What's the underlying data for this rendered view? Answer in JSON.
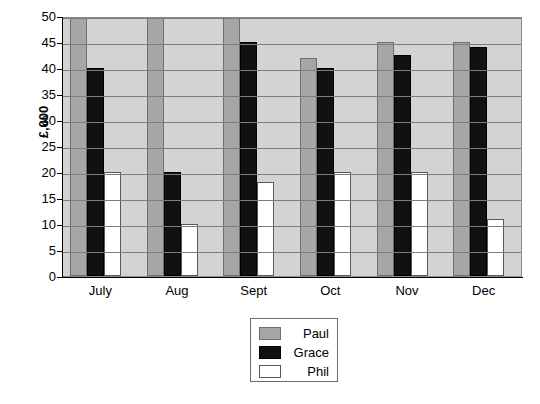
{
  "chart_data": {
    "type": "bar",
    "title": "",
    "xlabel": "",
    "ylabel": "£,000",
    "categories": [
      "July",
      "Aug",
      "Sept",
      "Oct",
      "Nov",
      "Dec"
    ],
    "ylim": [
      0,
      50
    ],
    "ytick_step": 5,
    "yticks": [
      50,
      45,
      40,
      35,
      30,
      25,
      20,
      15,
      10,
      5,
      0
    ],
    "grid": true,
    "legend_position": "bottom-center",
    "series": [
      {
        "name": "Paul",
        "color": "#a6a6a6",
        "values": [
          50,
          50,
          50,
          42,
          45,
          45
        ],
        "clipped_at_top": [
          true,
          true,
          true,
          false,
          false,
          false
        ]
      },
      {
        "name": "Grace",
        "color": "#111111",
        "values": [
          40,
          20,
          45,
          40,
          42.5,
          44
        ],
        "clipped_at_top": [
          false,
          false,
          false,
          false,
          false,
          false
        ]
      },
      {
        "name": "Phil",
        "color": "#ffffff",
        "values": [
          20,
          10,
          18,
          20,
          20,
          11
        ],
        "clipped_at_top": [
          false,
          false,
          false,
          false,
          false,
          false
        ]
      }
    ]
  },
  "legend": {
    "entries": [
      {
        "label": "Paul",
        "swatch": "paul"
      },
      {
        "label": "Grace",
        "swatch": "grace"
      },
      {
        "label": "Phil",
        "swatch": "phil"
      }
    ]
  },
  "colors": {
    "plot_background": "#d3d3d3",
    "gridline": "#7d7d7d",
    "axis": "#000000",
    "page_background": "#ffffff"
  }
}
